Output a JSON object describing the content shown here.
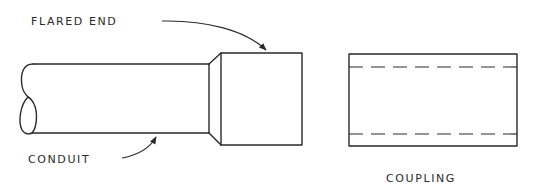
{
  "diagram": {
    "labels": {
      "flared_end": "FLARED END",
      "conduit": "CONDUIT",
      "coupling": "COUPLING"
    },
    "colors": {
      "line": "#2a2a2a",
      "background": "#ffffff"
    }
  }
}
